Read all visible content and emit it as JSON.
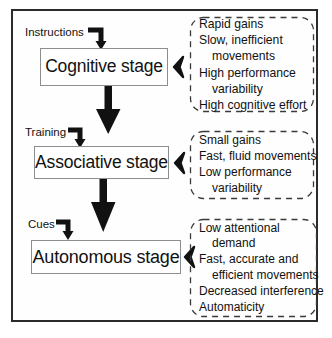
{
  "figure": {
    "frame_color": "#2b2b2b",
    "box_border_color": "#8d8d8d",
    "arrow_color": "#111111",
    "callout_border_color": "#3a3a3a"
  },
  "stages": [
    {
      "id": "cognitive",
      "label": "Cognitive stage",
      "input_label": "Instructions",
      "connector_icon": "chevron-left-icon",
      "features": [
        {
          "text": "Rapid gains",
          "indent": false
        },
        {
          "text": "Slow, inefficient",
          "indent": false
        },
        {
          "text": "movements",
          "indent": true
        },
        {
          "text": "High performance",
          "indent": false
        },
        {
          "text": "variability",
          "indent": true
        },
        {
          "text": "High cognitive effort",
          "indent": false
        }
      ]
    },
    {
      "id": "associative",
      "label": "Associative stage",
      "input_label": "Training",
      "connector_icon": "chevron-left-icon",
      "features": [
        {
          "text": "Small gains",
          "indent": false
        },
        {
          "text": "Fast, fluid movements",
          "indent": false
        },
        {
          "text": "Low performance",
          "indent": false
        },
        {
          "text": "variability",
          "indent": true
        }
      ]
    },
    {
      "id": "autonomous",
      "label": "Autonomous stage",
      "input_label": "Cues",
      "connector_icon": "chevron-left-icon",
      "features": [
        {
          "text": "Low attentional",
          "indent": false
        },
        {
          "text": "demand",
          "indent": true
        },
        {
          "text": "Fast, accurate and",
          "indent": false
        },
        {
          "text": "efficient movements",
          "indent": true
        },
        {
          "text": "Decreased interference",
          "indent": false
        },
        {
          "text": "Automaticity",
          "indent": false
        }
      ]
    }
  ],
  "flow_arrows": [
    {
      "name": "cognitive-to-associative",
      "from": "Cognitive stage",
      "to": "Associative stage"
    },
    {
      "name": "associative-to-autonomous",
      "from": "Associative stage",
      "to": "Autonomous stage"
    }
  ]
}
